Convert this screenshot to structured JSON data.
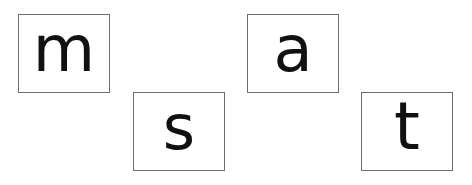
{
  "cards": [
    {
      "letter": "m"
    },
    {
      "letter": "s"
    },
    {
      "letter": "a"
    },
    {
      "letter": "t"
    }
  ],
  "colors": {
    "background": "#ffffff",
    "border": "#6e6e6e",
    "text": "#111111"
  }
}
